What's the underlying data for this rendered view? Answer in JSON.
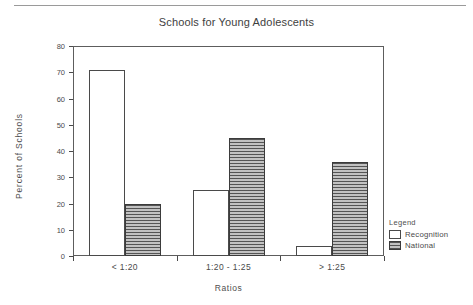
{
  "chart_data": {
    "type": "bar",
    "title": "Schools for Young Adolescents",
    "xlabel": "Ratios",
    "ylabel": "Percent of Schools",
    "categories": [
      "< 1:20",
      "1:20 - 1:25",
      "> 1:25"
    ],
    "series": [
      {
        "name": "Recognition",
        "values": [
          71,
          25,
          4
        ],
        "fill": "white",
        "pattern": "solid-white"
      },
      {
        "name": "National",
        "values": [
          20,
          45,
          36
        ],
        "fill": "#9b9b9b",
        "pattern": "horizontal-hatch"
      }
    ],
    "ylim": [
      0,
      80
    ],
    "ytick_labels": [
      "0",
      "10",
      "20",
      "30",
      "40",
      "50",
      "60",
      "70",
      "80"
    ],
    "ytick_values": [
      0,
      10,
      20,
      30,
      40,
      50,
      60,
      70,
      80
    ],
    "grid": false,
    "legend_position": "right-bottom-outside",
    "legend_title": "Legend"
  },
  "legend": {
    "title": "Legend",
    "entries": [
      {
        "label": "Recognition"
      },
      {
        "label": "National"
      }
    ]
  },
  "colors": {
    "axis": "#4a4a4a",
    "frame": "#5d5d5d",
    "text": "#4f4f4f",
    "national_fill": "#9b9b9b",
    "recognition_fill": "#ffffff",
    "page_rule": "#9a9a9a"
  }
}
